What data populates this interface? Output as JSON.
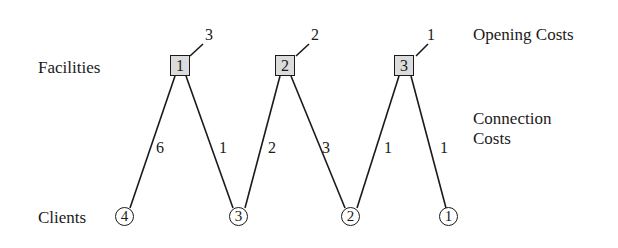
{
  "labels": {
    "facilities": "Facilities",
    "clients": "Clients",
    "opening_costs": "Opening Costs",
    "connection_line1": "Connection",
    "connection_line2": "Costs"
  },
  "facilities": [
    {
      "id": "1",
      "opening_cost": "3"
    },
    {
      "id": "2",
      "opening_cost": "2"
    },
    {
      "id": "3",
      "opening_cost": "1"
    }
  ],
  "clients": [
    {
      "id": "4"
    },
    {
      "id": "3"
    },
    {
      "id": "2"
    },
    {
      "id": "1"
    }
  ],
  "edges": [
    {
      "facility": "1",
      "client": "4",
      "cost": "6"
    },
    {
      "facility": "1",
      "client": "3",
      "cost": "1"
    },
    {
      "facility": "2",
      "client": "3",
      "cost": "2"
    },
    {
      "facility": "2",
      "client": "2",
      "cost": "3"
    },
    {
      "facility": "3",
      "client": "2",
      "cost": "1"
    },
    {
      "facility": "3",
      "client": "1",
      "cost": "1"
    }
  ],
  "colors": {
    "facility_fill": "#dcdcdc",
    "stroke": "#1a1a1a"
  }
}
